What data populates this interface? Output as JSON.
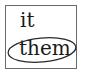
{
  "diagram": {
    "words": [
      "it",
      "them"
    ],
    "circled_word_index": 1,
    "colors": {
      "text": "#1a1a1a",
      "border": "#6a6a6a",
      "ellipse": "#2a2a2a"
    }
  }
}
